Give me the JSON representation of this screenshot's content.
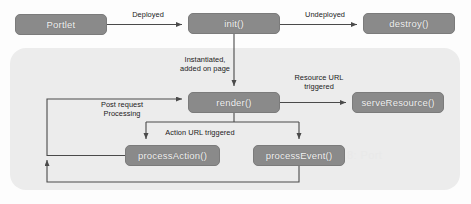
{
  "diagram": {
    "colors": {
      "node_fill": "#8a8a8a",
      "node_border": "#7b7b7b",
      "node_text": "#f2f2f2",
      "panel_fill": "#ececec",
      "line": "#4a4a4a",
      "background": "#fdfdfd"
    },
    "nodes": [
      {
        "id": "portlet",
        "label": "Portlet",
        "x": 15,
        "y": 14,
        "w": 92,
        "h": 21
      },
      {
        "id": "init",
        "label": "init()",
        "x": 188,
        "y": 13,
        "w": 92,
        "h": 21
      },
      {
        "id": "destroy",
        "label": "destroy()",
        "x": 363,
        "y": 13,
        "w": 92,
        "h": 21
      },
      {
        "id": "render",
        "label": "render()",
        "x": 188,
        "y": 92,
        "w": 92,
        "h": 21
      },
      {
        "id": "serveresource",
        "label": "serveResource()",
        "x": 352,
        "y": 92,
        "w": 92,
        "h": 21
      },
      {
        "id": "processaction",
        "label": "processAction()",
        "x": 125,
        "y": 145,
        "w": 95,
        "h": 21
      },
      {
        "id": "processevent",
        "label": "processEvent()",
        "x": 253,
        "y": 145,
        "w": 92,
        "h": 21
      }
    ],
    "edge_labels": [
      {
        "id": "deployed",
        "text": "Deployed",
        "x": 117,
        "y": 10,
        "w": 62
      },
      {
        "id": "undeployed",
        "text": "Undeployed",
        "x": 291,
        "y": 10,
        "w": 68
      },
      {
        "id": "instantiated",
        "text": "Instantiated,\nadded on page",
        "x": 165,
        "y": 55,
        "w": 80
      },
      {
        "id": "resource-url",
        "text": "Resource URL\ntriggered",
        "x": 285,
        "y": 73,
        "w": 68
      },
      {
        "id": "post-request",
        "text": "Post request\nProcessing",
        "x": 88,
        "y": 100,
        "w": 68
      },
      {
        "id": "action-url",
        "text": "Action URL triggered",
        "x": 155,
        "y": 128,
        "w": 90
      }
    ],
    "background_text": [
      {
        "id": "figure-caption-ghost",
        "text": "Figure 2.8:  Port",
        "x": 300,
        "y": 149
      }
    ]
  }
}
